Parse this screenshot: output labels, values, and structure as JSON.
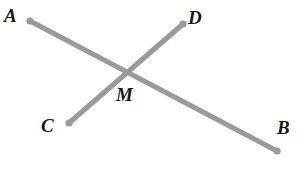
{
  "figure": {
    "kind": "geometry-diagram",
    "width": 308,
    "height": 175,
    "background_color": "#ffffff",
    "stroke_color": "#9a9a9a",
    "stroke_width": 5,
    "point_color": "#9a9a9a",
    "point_radius": 3.6,
    "label_color": "#1a1a1a"
  },
  "labels": {
    "a": "A",
    "b": "B",
    "c": "C",
    "d": "D",
    "m": "M"
  },
  "points": {
    "A": {
      "x": 30,
      "y": 21
    },
    "B": {
      "x": 277,
      "y": 151
    },
    "C": {
      "x": 69,
      "y": 123
    },
    "D": {
      "x": 183,
      "y": 24
    },
    "M": {
      "x": 126,
      "y": 75
    }
  },
  "label_positions": {
    "A": {
      "left": 4,
      "top": 6
    },
    "B": {
      "left": 277,
      "top": 118
    },
    "C": {
      "left": 41,
      "top": 116
    },
    "D": {
      "left": 188,
      "top": 8
    },
    "M": {
      "left": 116,
      "top": 85
    }
  },
  "segments": [
    {
      "name": "segment-ab",
      "from": "A",
      "to": "B"
    },
    {
      "name": "segment-cd",
      "from": "C",
      "to": "D"
    }
  ],
  "vertex_dots": [
    "A",
    "B",
    "C",
    "D"
  ]
}
